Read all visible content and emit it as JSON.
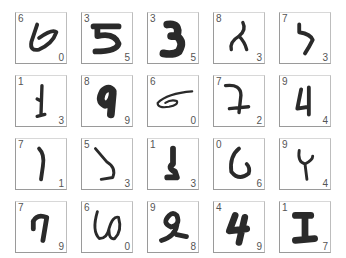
{
  "grid": {
    "rows": 4,
    "cols": 5,
    "cells": [
      {
        "top_left": "6",
        "bottom_right": "0",
        "digit": "6"
      },
      {
        "top_left": "3",
        "bottom_right": "5",
        "digit": "5"
      },
      {
        "top_left": "3",
        "bottom_right": "5",
        "digit": "3"
      },
      {
        "top_left": "8",
        "bottom_right": "3",
        "digit": "8"
      },
      {
        "top_left": "7",
        "bottom_right": "3",
        "digit": "7"
      },
      {
        "top_left": "1",
        "bottom_right": "3",
        "digit": "1"
      },
      {
        "top_left": "8",
        "bottom_right": "9",
        "digit": "9"
      },
      {
        "top_left": "6",
        "bottom_right": "0",
        "digit": "6"
      },
      {
        "top_left": "7",
        "bottom_right": "2",
        "digit": "7"
      },
      {
        "top_left": "9",
        "bottom_right": "4",
        "digit": "4"
      },
      {
        "top_left": "7",
        "bottom_right": "1",
        "digit": "1"
      },
      {
        "top_left": "5",
        "bottom_right": "3",
        "digit": "5"
      },
      {
        "top_left": "1",
        "bottom_right": "3",
        "digit": "3"
      },
      {
        "top_left": "0",
        "bottom_right": "6",
        "digit": "6"
      },
      {
        "top_left": "9",
        "bottom_right": "4",
        "digit": "4"
      },
      {
        "top_left": "7",
        "bottom_right": "9",
        "digit": "9"
      },
      {
        "top_left": "6",
        "bottom_right": "0",
        "digit": "6"
      },
      {
        "top_left": "9",
        "bottom_right": "8",
        "digit": "9"
      },
      {
        "top_left": "4",
        "bottom_right": "9",
        "digit": "4"
      },
      {
        "top_left": "1",
        "bottom_right": "7",
        "digit": "1"
      }
    ]
  }
}
